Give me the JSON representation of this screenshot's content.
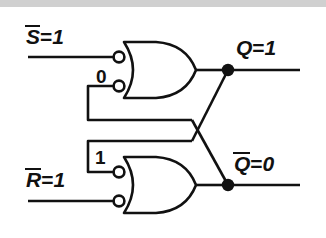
{
  "figure": {
    "kind": "logic-circuit-schematic",
    "background_color": "#ffffff",
    "line_color": "#111111",
    "top_band_color": "#d0d0d0"
  },
  "signals": {
    "set_bar": {
      "name": "S",
      "overbar": true,
      "equals": "=",
      "value": "1"
    },
    "reset_bar": {
      "name": "R",
      "overbar": true,
      "equals": "=",
      "value": "1"
    },
    "q": {
      "name": "Q",
      "overbar": false,
      "equals": "=",
      "value": "1"
    },
    "q_bar": {
      "name": "Q",
      "overbar": true,
      "equals": "=",
      "value": "0"
    }
  },
  "pin_annotations": {
    "top_gate_feedback": "0",
    "bottom_gate_feedback": "1"
  },
  "gates": [
    {
      "id": "gate-top",
      "type": "nor",
      "symbol": "or-body-with-input-bubbles",
      "inputs": [
        "S-bar",
        "feedback-from-Q-bar"
      ],
      "output": "Q",
      "output_value": "1"
    },
    {
      "id": "gate-bottom",
      "type": "nor",
      "symbol": "or-body-with-input-bubbles",
      "inputs": [
        "feedback-from-Q",
        "R-bar"
      ],
      "output": "Q-bar",
      "output_value": "0"
    }
  ],
  "nodes": [
    {
      "id": "junction-q",
      "label": "Q",
      "type": "filled-dot"
    },
    {
      "id": "junction-qbar",
      "label": "Q-bar",
      "type": "filled-dot"
    }
  ],
  "crossing": {
    "type": "non-connecting-wire-crossing",
    "note": "Q feeds bottom gate upper input; Q-bar feeds top gate lower input"
  }
}
